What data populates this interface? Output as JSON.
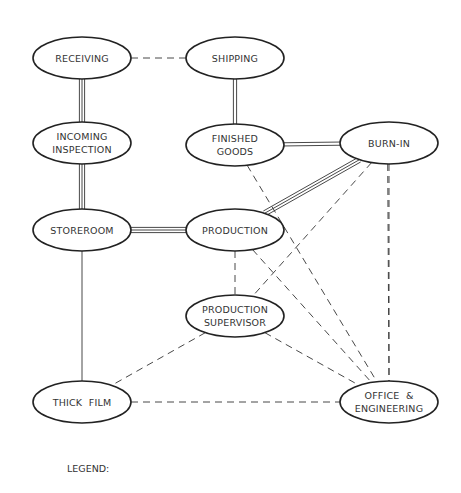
{
  "diagram": {
    "nodes": [
      {
        "id": "receiving",
        "lines": [
          "RECEIVING"
        ],
        "cx": 82,
        "cy": 58
      },
      {
        "id": "shipping",
        "lines": [
          "SHIPPING"
        ],
        "cx": 235,
        "cy": 58
      },
      {
        "id": "incoming",
        "lines": [
          "INCOMING",
          "INSPECTION"
        ],
        "cx": 82,
        "cy": 143
      },
      {
        "id": "finished",
        "lines": [
          "FINISHED",
          "GOODS"
        ],
        "cx": 235,
        "cy": 145
      },
      {
        "id": "burnin",
        "lines": [
          "BURN-IN"
        ],
        "cx": 389,
        "cy": 143
      },
      {
        "id": "storeroom",
        "lines": [
          "STOREROOM"
        ],
        "cx": 82,
        "cy": 230
      },
      {
        "id": "production",
        "lines": [
          "PRODUCTION"
        ],
        "cx": 235,
        "cy": 230
      },
      {
        "id": "supervisor",
        "lines": [
          "PRODUCTION",
          "SUPERVISOR"
        ],
        "cx": 235,
        "cy": 316
      },
      {
        "id": "thickfilm",
        "lines": [
          "THICK  FILM"
        ],
        "cx": 82,
        "cy": 402
      },
      {
        "id": "office",
        "lines": [
          "OFFICE  &",
          "ENGINEERING"
        ],
        "cx": 389,
        "cy": 402
      }
    ],
    "edges": [
      {
        "from": "receiving",
        "to": "shipping",
        "style": "dashed"
      },
      {
        "from": "receiving",
        "to": "incoming",
        "style": "triple"
      },
      {
        "from": "incoming",
        "to": "storeroom",
        "style": "triple"
      },
      {
        "from": "storeroom",
        "to": "production",
        "style": "triple"
      },
      {
        "from": "shipping",
        "to": "finished",
        "style": "double"
      },
      {
        "from": "finished",
        "to": "burnin",
        "style": "double"
      },
      {
        "from": "production",
        "to": "burnin",
        "style": "triple"
      },
      {
        "from": "storeroom",
        "to": "thickfilm",
        "style": "single"
      },
      {
        "from": "production",
        "to": "supervisor",
        "style": "dashed"
      },
      {
        "from": "finished",
        "to": "office",
        "style": "dashed"
      },
      {
        "from": "production",
        "to": "office",
        "style": "dashed"
      },
      {
        "from": "burnin",
        "to": "office",
        "style": "dashed"
      },
      {
        "from": "burnin",
        "to": "supervisor",
        "style": "dashed"
      },
      {
        "from": "burnin",
        "to": "office_left",
        "style": "dashed"
      },
      {
        "from": "supervisor",
        "to": "thickfilm",
        "style": "dashed"
      },
      {
        "from": "supervisor",
        "to": "office",
        "style": "dashed"
      },
      {
        "from": "thickfilm",
        "to": "office",
        "style": "dashed"
      }
    ]
  },
  "legend": {
    "label": "LEGEND:"
  }
}
